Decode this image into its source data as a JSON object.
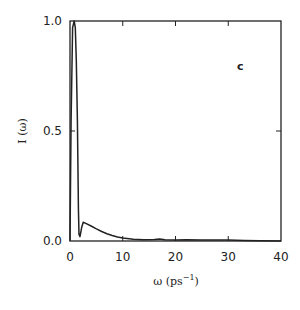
{
  "chart_data": {
    "type": "line",
    "title": "",
    "panel_label": "c",
    "xlabel": "ω (ps",
    "xlabel_sup": "−1",
    "xlabel_close": ")",
    "ylabel": "I (ω)",
    "xlim": [
      0,
      40
    ],
    "ylim": [
      0,
      1.0
    ],
    "xticks": [
      0,
      10,
      20,
      30,
      40
    ],
    "xtick_labels": [
      "0",
      "10",
      "20",
      "30",
      "40"
    ],
    "yticks": [
      0.0,
      0.5,
      1.0
    ],
    "ytick_labels": [
      "0.0",
      "0.5",
      "1.0"
    ],
    "grid": false,
    "legend": null,
    "series": [
      {
        "name": "I(ω)",
        "color": "#222222",
        "x": [
          0.0,
          0.2,
          0.5,
          0.8,
          1.0,
          1.2,
          1.4,
          1.5,
          1.6,
          1.7,
          1.9,
          2.2,
          2.5,
          3.0,
          4.0,
          5.0,
          6.0,
          7.0,
          8.0,
          9.0,
          10.0,
          12.0,
          14.0,
          16.0,
          17.0,
          18.0,
          20.0,
          22.0,
          25.0,
          28.0,
          30.0,
          33.0,
          36.0,
          40.0
        ],
        "y": [
          0.0,
          0.55,
          0.97,
          1.0,
          0.97,
          0.82,
          0.55,
          0.35,
          0.15,
          0.03,
          0.02,
          0.06,
          0.085,
          0.08,
          0.068,
          0.055,
          0.043,
          0.033,
          0.025,
          0.018,
          0.013,
          0.008,
          0.006,
          0.007,
          0.009,
          0.006,
          0.005,
          0.006,
          0.005,
          0.004,
          0.004,
          0.002,
          0.001,
          0.0
        ]
      }
    ]
  }
}
